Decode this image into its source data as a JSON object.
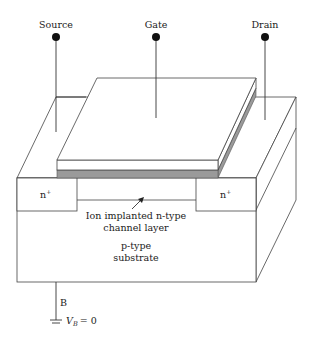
{
  "diagram": {
    "type": "ion-implanted n-channel depletion MOSFET cross-section",
    "terminals": {
      "source": {
        "label": "Source"
      },
      "gate": {
        "label": "Gate"
      },
      "drain": {
        "label": "Drain"
      },
      "body": {
        "label": "B",
        "ground_label_var": "V",
        "ground_label_sub": "B",
        "ground_label_value": "= 0"
      }
    },
    "regions": {
      "source_doping": {
        "label": "n",
        "sup": "+"
      },
      "drain_doping": {
        "label": "n",
        "sup": "+"
      },
      "channel": {
        "line1": "Ion implanted n-type",
        "line2": "channel layer"
      },
      "substrate": {
        "line1": "p-type",
        "line2": "substrate"
      }
    },
    "colors": {
      "oxide": "#9a9a9a",
      "lines": "#444444",
      "background": "#ffffff"
    }
  }
}
